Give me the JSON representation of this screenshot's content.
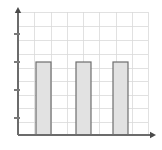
{
  "chart_data": {
    "type": "bar",
    "title": "",
    "subtitle": "",
    "xlabel": "",
    "ylabel": "",
    "categories": [
      "1",
      "2",
      "3"
    ],
    "values": [
      3,
      3,
      3
    ],
    "series": [
      {
        "name": "series-1",
        "values": [
          3,
          3,
          3
        ]
      }
    ],
    "xlim": [
      0,
      8
    ],
    "ylim": [
      0,
      4.4
    ],
    "yticks": [
      1,
      2,
      3,
      4
    ],
    "ytick_labels": [
      "",
      "",
      "",
      ""
    ],
    "xticks": [],
    "xtick_labels": [],
    "grid": "on",
    "grid_columns": 8,
    "grid_rows": 9,
    "legend": "none",
    "legend_position": "none",
    "annotations": [],
    "bar_positions": [
      1.1,
      3.4,
      5.6
    ],
    "bar_width": 0.9,
    "colors": {
      "background": "#ffffff",
      "bar_fill": "#e2e2e2",
      "bar_stroke": "#6e6e6e",
      "grid": "#d9d9d9",
      "axis": "#6b6b6b",
      "tick": "#7a7a7a",
      "arrow": "#4a4a4a"
    }
  },
  "geometry": {
    "plot_left": 18,
    "plot_right": 148,
    "plot_top": 12,
    "plot_bottom": 135,
    "y_axis_x": 18,
    "x_axis_y": 135,
    "y_arrow_tip_y": 7,
    "x_arrow_tip_x": 156,
    "tick_positions_y": [
      34,
      62,
      90,
      118
    ],
    "tick_length": 5,
    "bars": [
      {
        "x": 36,
        "width": 15,
        "top": 62
      },
      {
        "x": 76,
        "width": 15,
        "top": 62
      },
      {
        "x": 113,
        "width": 15,
        "top": 62
      }
    ],
    "vertical_grid_x": [
      18,
      34,
      51,
      67,
      83,
      99,
      116,
      132,
      148
    ],
    "horizontal_grid_y": [
      12,
      26,
      40,
      54,
      68,
      81,
      95,
      108,
      122,
      135
    ]
  },
  "accessibility": {
    "chart_label": "Bar chart with three equal-height bars on a grid with arrowed axes"
  }
}
